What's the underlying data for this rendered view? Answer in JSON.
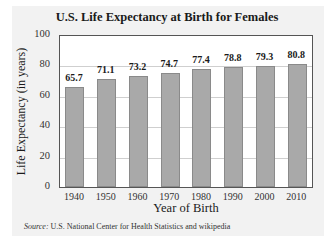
{
  "chart_data": {
    "type": "bar",
    "title": "U.S. Life Expectancy at Birth for Females",
    "xlabel": "Year of Birth",
    "ylabel": "Life Expectancy (in years)",
    "categories": [
      "1940",
      "1950",
      "1960",
      "1970",
      "1980",
      "1990",
      "2000",
      "2010"
    ],
    "values": [
      65.7,
      71.1,
      73.2,
      74.7,
      77.4,
      78.8,
      79.3,
      80.8
    ],
    "value_labels": [
      "65.7",
      "71.1",
      "73.2",
      "74.7",
      "77.4",
      "78.8",
      "79.3",
      "80.8"
    ],
    "ylim": [
      0,
      100
    ],
    "yticks": [
      "0",
      "20",
      "40",
      "60",
      "80",
      "100"
    ],
    "grid": true,
    "legend": null,
    "bar_color": "#a9a9a9",
    "source_label": "Source:",
    "source_text": " U.S. National Center for Health Statistics and wikipedia"
  }
}
